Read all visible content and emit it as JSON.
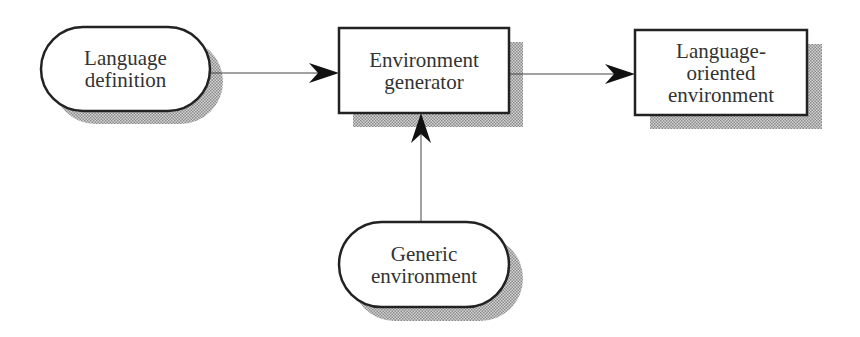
{
  "diagram": {
    "type": "flowchart",
    "colors": {
      "stroke": "#222222",
      "shadow": "#a8a8a8",
      "text": "#333333",
      "background": "#ffffff"
    },
    "nodes": [
      {
        "id": "language-definition",
        "shape": "pill",
        "lines": [
          "Language",
          "definition"
        ]
      },
      {
        "id": "environment-generator",
        "shape": "rectangle",
        "lines": [
          "Environment",
          "generator"
        ]
      },
      {
        "id": "language-oriented-environment",
        "shape": "rectangle",
        "lines": [
          "Language-",
          "oriented",
          "environment"
        ]
      },
      {
        "id": "generic-environment",
        "shape": "pill",
        "lines": [
          "Generic",
          "environment"
        ]
      }
    ],
    "edges": [
      {
        "from": "language-definition",
        "to": "environment-generator"
      },
      {
        "from": "environment-generator",
        "to": "language-oriented-environment"
      },
      {
        "from": "generic-environment",
        "to": "environment-generator"
      }
    ]
  }
}
